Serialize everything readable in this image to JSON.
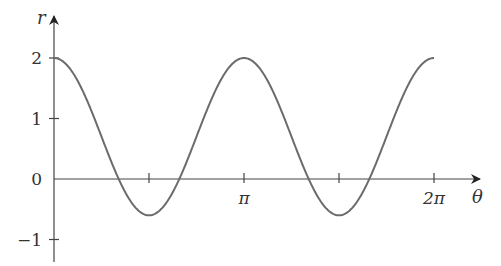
{
  "chart_data": {
    "type": "line",
    "title": "",
    "xlabel": "θ",
    "ylabel": "r",
    "function": "r = 0.7 + 1.3 cos(2θ)",
    "xlim": [
      0,
      6.2832
    ],
    "ylim": [
      -1.35,
      2.7
    ],
    "x_ticks": [
      {
        "value": 1.5708,
        "label": ""
      },
      {
        "value": 3.1416,
        "label": "π"
      },
      {
        "value": 4.7124,
        "label": ""
      },
      {
        "value": 6.2832,
        "label": "2π"
      }
    ],
    "y_ticks": [
      {
        "value": 2,
        "label": "2"
      },
      {
        "value": 1,
        "label": "1"
      },
      {
        "value": 0,
        "label": "0"
      },
      {
        "value": -1,
        "label": "−1"
      }
    ],
    "grid": false,
    "legend": null,
    "series": [
      {
        "name": "r(θ)",
        "x": [
          0,
          0.7854,
          1.0681,
          1.5708,
          2.0735,
          2.3562,
          3.1416,
          3.927,
          4.2097,
          4.7124,
          5.2151,
          5.4978,
          6.2832
        ],
        "y": [
          2.0,
          0.7,
          0.0,
          -0.6,
          0.0,
          0.7,
          2.0,
          0.7,
          0.0,
          -0.6,
          0.0,
          0.7,
          2.0
        ]
      }
    ],
    "colors": {
      "curve": "#6b6b6b",
      "axis": "#444444",
      "text": "#333333"
    }
  }
}
